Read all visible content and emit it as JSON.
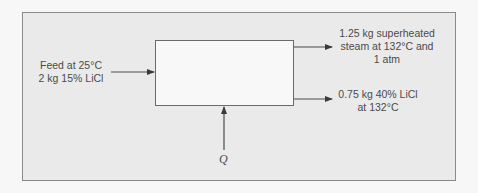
{
  "diagram": {
    "type": "process flow / evaporator mass balance",
    "unit": {
      "label": ""
    },
    "streams": {
      "feed": {
        "line1": "Feed at 25°C",
        "line2": "2 kg 15% LiCl"
      },
      "steam": {
        "line1": "1.25 kg superheated",
        "line2": "steam at 132°C and",
        "line3": "1 atm"
      },
      "liquid": {
        "line1": "0.75 kg 40% LiCl",
        "line2": "at 132°C"
      },
      "heat": {
        "label": "Q"
      }
    },
    "colors": {
      "panel_bg": "#eaeaea",
      "panel_border": "#8a8a8a",
      "box_bg": "#f8f8f8",
      "line": "#4a4a4a",
      "text": "#4a4a4a"
    }
  }
}
